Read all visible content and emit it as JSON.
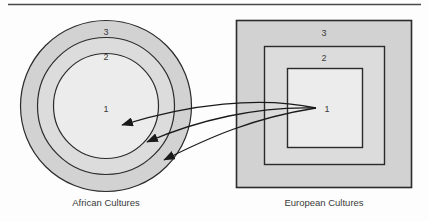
{
  "figure": {
    "title_rule": "horizontal-rule",
    "background_color": "#fdfdfd"
  },
  "left_diagram": {
    "name": "african-cultures-rings",
    "caption": "African Cultures",
    "shape": "concentric-circles",
    "center": {
      "x": 106,
      "y": 106
    },
    "rings": [
      {
        "label": "3",
        "radius": 86,
        "fill": "#d2d2d2",
        "label_x": 106,
        "label_y": 35
      },
      {
        "label": "2",
        "radius": 69,
        "fill": "#dcdcdc",
        "label_x": 106,
        "label_y": 60
      },
      {
        "label": "1",
        "radius": 53,
        "fill": "#ececec",
        "label_x": 106,
        "label_y": 112
      }
    ]
  },
  "right_diagram": {
    "name": "european-cultures-squares",
    "caption": "European Cultures",
    "shape": "nested-squares",
    "boxes": [
      {
        "label": "3",
        "x": 236,
        "y": 20,
        "width": 176,
        "height": 168,
        "fill": "#d2d2d2",
        "label_x": 324,
        "label_y": 36
      },
      {
        "label": "2",
        "x": 264,
        "y": 46,
        "width": 121,
        "height": 119,
        "fill": "#dcdcdc",
        "label_x": 324,
        "label_y": 61
      },
      {
        "label": "1",
        "x": 287,
        "y": 68,
        "width": 76,
        "height": 80,
        "fill": "#ececec",
        "label_x": 327,
        "label_y": 112
      }
    ]
  },
  "arrows": {
    "name": "transfer-arrows",
    "count": 3,
    "origin": {
      "x": 316,
      "y": 108
    },
    "targets": [
      {
        "x": 118,
        "y": 126,
        "to_ring": "1"
      },
      {
        "x": 143,
        "y": 143,
        "to_ring": "2"
      },
      {
        "x": 160,
        "y": 161,
        "to_ring": "3"
      }
    ],
    "color": "#1a1a1a"
  },
  "colors": {
    "stroke": "#2b2b2b",
    "outer_fill": "#d2d2d2",
    "middle_fill": "#dcdcdc",
    "inner_fill": "#ececec",
    "rule": "#4a4a4a",
    "text": "#3a3a3a"
  }
}
